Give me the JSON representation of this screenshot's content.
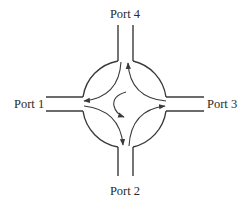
{
  "diagram": {
    "ports": [
      {
        "id": "port1",
        "label": "Port 1",
        "side": "left"
      },
      {
        "id": "port2",
        "label": "Port 2",
        "side": "bottom"
      },
      {
        "id": "port3",
        "label": "Port 3",
        "side": "right"
      },
      {
        "id": "port4",
        "label": "Port 4",
        "side": "top"
      }
    ],
    "flows": [
      {
        "from": "Port 1",
        "to": "Port 2"
      },
      {
        "from": "Port 2",
        "to": "Port 3"
      },
      {
        "from": "Port 3",
        "to": "Port 4"
      },
      {
        "from": "Port 4",
        "to": "Port 1"
      }
    ],
    "rotation": "clockwise",
    "colors": {
      "line": "#3a3a3a",
      "text": "#2a2a2a",
      "background": "#ffffff"
    }
  }
}
